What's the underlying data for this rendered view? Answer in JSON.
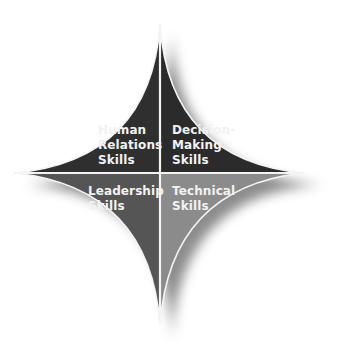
{
  "diagram": {
    "type": "four-quadrant concave star",
    "colors": {
      "background": "#ffffff",
      "divider": "#f4f4f4",
      "shadow": "#000000"
    },
    "quadrants": [
      {
        "id": "top-left",
        "lines": [
          "Human",
          "Relations",
          "Skills"
        ],
        "fill": "#2f2f2f"
      },
      {
        "id": "top-right",
        "lines": [
          "Decision-",
          "Making",
          "Skills"
        ],
        "fill": "#2b2b2b"
      },
      {
        "id": "bottom-left",
        "lines": [
          "Leadership",
          "Skills"
        ],
        "fill": "#555555"
      },
      {
        "id": "bottom-right",
        "lines": [
          "Technical",
          "Skills"
        ],
        "fill": "#8b8b8b"
      }
    ]
  }
}
